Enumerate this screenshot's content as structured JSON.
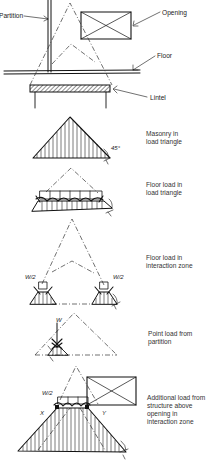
{
  "figure": {
    "top_view": {
      "labels": {
        "partition": "Partition",
        "opening": "Opening",
        "floor": "Floor",
        "lintel": "Lintel"
      }
    },
    "panels": [
      {
        "id": "masonry",
        "caption_line1": "Masonry in",
        "caption_line2": "load triangle",
        "angle_label": "45°"
      },
      {
        "id": "floor-triangle",
        "caption_line1": "Floor load in",
        "caption_line2": "load triangle"
      },
      {
        "id": "floor-interaction",
        "caption_line1": "Floor load in",
        "caption_line2": "interaction zone",
        "left_load": "W/2",
        "right_load": "W/2"
      },
      {
        "id": "point-load",
        "caption_line1": "Point load from",
        "caption_line2": "partition",
        "load": "W"
      },
      {
        "id": "additional-load",
        "caption_line1": "Additional load from",
        "caption_line2": "structure above",
        "caption_line3": "opening in",
        "caption_line4": "interaction zone",
        "load": "W/2",
        "marker_x": "X",
        "marker_y": "Y"
      }
    ]
  }
}
